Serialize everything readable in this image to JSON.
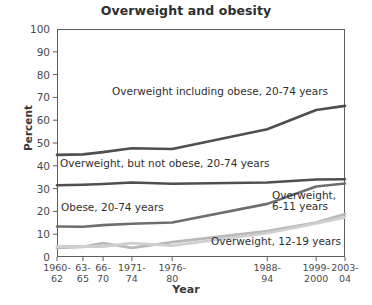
{
  "chart_data": {
    "type": "line",
    "title": "Overweight and obesity",
    "xlabel": "Year",
    "ylabel": "Percent",
    "ylim": [
      0,
      100
    ],
    "ytick_step": 10,
    "yticks": [
      "100",
      "90",
      "80",
      "70",
      "60",
      "50",
      "40",
      "30",
      "20",
      "10",
      "0"
    ],
    "categories": [
      "1960-\n62",
      "63-\n65",
      "66-\n70",
      "1971-\n74",
      "1976-\n80",
      "1988-\n94",
      "1999-\n2000",
      "2003-\n04"
    ],
    "category_positions": [
      0.0,
      9.0,
      16.0,
      26.0,
      40.0,
      73.0,
      90.0,
      100.0
    ],
    "grid": false,
    "legend": "inline-annotations",
    "series": [
      {
        "name": "Overweight including obese, 20-74 years",
        "color": "#4f4f4f",
        "width": 2.6,
        "values": [
          44.8,
          45.0,
          46.0,
          47.7,
          47.4,
          56.0,
          64.5,
          66.3
        ]
      },
      {
        "name": "Overweight, but not obese, 20-74 years",
        "color": "#4f4f4f",
        "width": 2.6,
        "values": [
          31.5,
          31.7,
          32.0,
          32.7,
          32.1,
          32.7,
          34.0,
          34.1
        ]
      },
      {
        "name": "Obese, 20-74 years",
        "color": "#6e6e6e",
        "width": 2.6,
        "values": [
          13.4,
          13.3,
          14.0,
          14.6,
          15.1,
          23.3,
          30.9,
          32.2
        ]
      },
      {
        "name": "Overweight, 6-11 years",
        "color": "#b9b9b9",
        "width": 2.8,
        "values": [
          4.0,
          4.4,
          6.1,
          4.0,
          6.5,
          11.3,
          15.1,
          18.8
        ]
      },
      {
        "name": "Overweight, 12-19 years",
        "color": "#cfcfcf",
        "width": 2.8,
        "values": [
          4.6,
          4.6,
          4.6,
          6.1,
          5.0,
          10.5,
          14.8,
          17.4
        ]
      }
    ],
    "annotations": [
      {
        "text": "Overweight including obese, 20-74 years",
        "x": 112,
        "y": 86
      },
      {
        "text": "Overweight, but not obese, 20-74 years",
        "x": 60,
        "y": 158
      },
      {
        "text": "Obese, 20-74 years",
        "x": 61,
        "y": 202
      },
      {
        "text": "Overweight,\n6-11 years",
        "x": 272,
        "y": 190
      },
      {
        "text": "Overweight, 12-19 years",
        "x": 211,
        "y": 236
      }
    ]
  }
}
